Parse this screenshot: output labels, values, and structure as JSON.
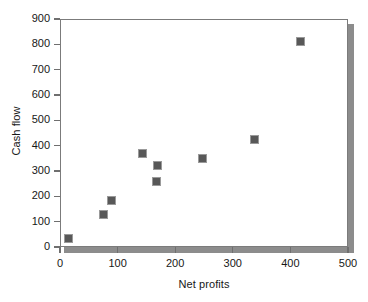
{
  "chart_data": {
    "type": "scatter",
    "title": "",
    "xlabel": "Net profits",
    "ylabel": "Cash flow",
    "xlim": [
      0,
      500
    ],
    "ylim": [
      0,
      900
    ],
    "xticks": [
      0,
      100,
      200,
      300,
      400,
      500
    ],
    "yticks": [
      0,
      100,
      200,
      300,
      400,
      500,
      600,
      700,
      800,
      900
    ],
    "xtick_labels": [
      "0",
      "100",
      "200",
      "300",
      "400",
      "500"
    ],
    "ytick_labels": [
      "0",
      "100",
      "200",
      "300",
      "400",
      "500",
      "600",
      "700",
      "800",
      "900"
    ],
    "grid": false,
    "legend": null,
    "marker": "square",
    "marker_color": "#585858",
    "points": [
      {
        "x": 14,
        "y": 32
      },
      {
        "x": 75,
        "y": 128
      },
      {
        "x": 90,
        "y": 185
      },
      {
        "x": 143,
        "y": 368
      },
      {
        "x": 170,
        "y": 322
      },
      {
        "x": 168,
        "y": 260
      },
      {
        "x": 247,
        "y": 348
      },
      {
        "x": 337,
        "y": 425
      },
      {
        "x": 417,
        "y": 813
      }
    ]
  }
}
